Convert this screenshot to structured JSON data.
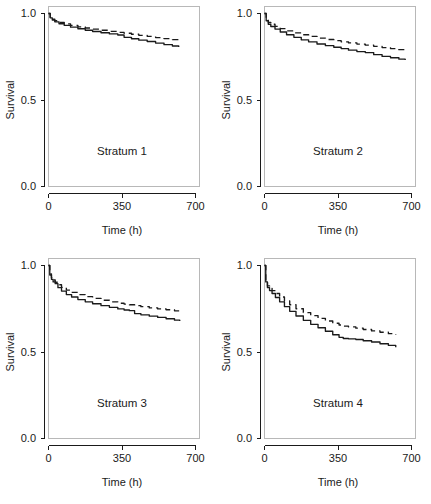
{
  "figure": {
    "name": "survival-curve-panel-grid",
    "panel_count": 4,
    "line_color": "#1a1a1a",
    "background": "#ffffff"
  },
  "axes": {
    "xlabel": "Time (h)",
    "ylabel": "Survival",
    "x_ticks": [
      "0",
      "350",
      "700"
    ],
    "y_ticks": [
      "0.0",
      "0.5",
      "1.0"
    ],
    "xlim": [
      0,
      700
    ],
    "ylim": [
      0,
      1
    ]
  },
  "panel_labels": {
    "p1": "Stratum 1",
    "p2": "Stratum 2",
    "p3": "Stratum 3",
    "p4": "Stratum 4"
  },
  "chart_data": {
    "type": "line",
    "title": "",
    "xlabel": "Time (h)",
    "ylabel": "Survival",
    "xlim": [
      0,
      700
    ],
    "ylim": [
      0,
      1
    ],
    "grid": false,
    "legend": "none",
    "panel_layout": "2x2",
    "x_ticks": [
      0,
      350,
      700
    ],
    "y_ticks": [
      0.0,
      0.5,
      1.0
    ],
    "panels": [
      {
        "label": "Stratum 1",
        "position": "top-left",
        "series": [
          {
            "name": "observed",
            "style": "solid",
            "x": [
              0,
              8,
              18,
              30,
              50,
              75,
              105,
              140,
              175,
              210,
              250,
              290,
              330,
              360,
              395,
              430,
              470,
              510,
              550,
              590,
              620
            ],
            "y": [
              1.0,
              0.975,
              0.962,
              0.952,
              0.941,
              0.931,
              0.921,
              0.912,
              0.903,
              0.896,
              0.889,
              0.882,
              0.876,
              0.862,
              0.854,
              0.846,
              0.838,
              0.829,
              0.82,
              0.812,
              0.806
            ]
          },
          {
            "name": "predicted",
            "style": "dashed",
            "x": [
              0,
              8,
              18,
              30,
              50,
              75,
              105,
              140,
              175,
              210,
              250,
              290,
              330,
              360,
              395,
              430,
              470,
              510,
              550,
              590,
              620
            ],
            "y": [
              1.0,
              0.978,
              0.967,
              0.958,
              0.949,
              0.94,
              0.931,
              0.923,
              0.916,
              0.91,
              0.903,
              0.897,
              0.891,
              0.886,
              0.88,
              0.874,
              0.868,
              0.861,
              0.855,
              0.849,
              0.845
            ]
          }
        ]
      },
      {
        "label": "Stratum 2",
        "position": "top-right",
        "series": [
          {
            "name": "observed",
            "style": "solid",
            "x": [
              0,
              8,
              18,
              30,
              50,
              75,
              105,
              140,
              175,
              210,
              250,
              290,
              330,
              365,
              400,
              440,
              480,
              520,
              560,
              600,
              640,
              670
            ],
            "y": [
              1.0,
              0.958,
              0.938,
              0.925,
              0.91,
              0.893,
              0.877,
              0.862,
              0.848,
              0.836,
              0.824,
              0.814,
              0.805,
              0.797,
              0.788,
              0.78,
              0.774,
              0.762,
              0.752,
              0.744,
              0.736,
              0.731
            ]
          },
          {
            "name": "predicted",
            "style": "dashed",
            "x": [
              0,
              8,
              18,
              30,
              50,
              75,
              105,
              140,
              175,
              210,
              250,
              290,
              330,
              365,
              400,
              440,
              480,
              520,
              560,
              600,
              640,
              670
            ],
            "y": [
              1.0,
              0.965,
              0.949,
              0.938,
              0.926,
              0.913,
              0.9,
              0.888,
              0.877,
              0.868,
              0.858,
              0.85,
              0.843,
              0.836,
              0.83,
              0.823,
              0.817,
              0.81,
              0.803,
              0.797,
              0.791,
              0.787
            ]
          }
        ]
      },
      {
        "label": "Stratum 3",
        "position": "bottom-left",
        "series": [
          {
            "name": "observed",
            "style": "solid",
            "x": [
              0,
              6,
              14,
              22,
              32,
              45,
              62,
              85,
              110,
              140,
              175,
              210,
              250,
              290,
              330,
              360,
              385,
              410,
              440,
              480,
              520,
              560,
              600,
              625
            ],
            "y": [
              1.0,
              0.945,
              0.92,
              0.905,
              0.895,
              0.872,
              0.852,
              0.832,
              0.818,
              0.803,
              0.79,
              0.779,
              0.768,
              0.758,
              0.749,
              0.743,
              0.739,
              0.722,
              0.715,
              0.707,
              0.7,
              0.692,
              0.684,
              0.679
            ]
          },
          {
            "name": "predicted",
            "style": "dashed",
            "x": [
              0,
              6,
              14,
              22,
              32,
              45,
              62,
              85,
              110,
              140,
              175,
              210,
              250,
              290,
              330,
              360,
              385,
              410,
              440,
              480,
              520,
              560,
              600,
              625
            ],
            "y": [
              1.0,
              0.952,
              0.93,
              0.916,
              0.903,
              0.889,
              0.874,
              0.858,
              0.845,
              0.832,
              0.82,
              0.81,
              0.799,
              0.79,
              0.782,
              0.777,
              0.773,
              0.768,
              0.762,
              0.755,
              0.749,
              0.744,
              0.738,
              0.735
            ]
          }
        ]
      },
      {
        "label": "Stratum 4",
        "position": "bottom-right",
        "series": [
          {
            "name": "observed",
            "style": "solid",
            "x": [
              0,
              6,
              14,
              24,
              36,
              52,
              72,
              95,
              120,
              150,
              185,
              220,
              255,
              290,
              325,
              355,
              375,
              400,
              435,
              470,
              510,
              550,
              590,
              625
            ],
            "y": [
              1.0,
              0.905,
              0.872,
              0.855,
              0.838,
              0.815,
              0.79,
              0.762,
              0.735,
              0.708,
              0.683,
              0.66,
              0.64,
              0.62,
              0.6,
              0.585,
              0.578,
              0.576,
              0.572,
              0.565,
              0.558,
              0.548,
              0.538,
              0.528
            ]
          },
          {
            "name": "predicted",
            "style": "dashed",
            "x": [
              0,
              6,
              14,
              24,
              36,
              52,
              72,
              95,
              120,
              150,
              185,
              220,
              255,
              290,
              325,
              355,
              375,
              400,
              435,
              470,
              510,
              550,
              590,
              625
            ],
            "y": [
              1.0,
              0.912,
              0.882,
              0.868,
              0.855,
              0.838,
              0.818,
              0.795,
              0.773,
              0.75,
              0.728,
              0.71,
              0.694,
              0.679,
              0.666,
              0.656,
              0.65,
              0.645,
              0.638,
              0.63,
              0.622,
              0.614,
              0.606,
              0.6
            ]
          }
        ]
      }
    ]
  }
}
